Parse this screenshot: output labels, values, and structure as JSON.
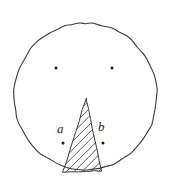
{
  "figure": {
    "kind": "hand-drawn-geometry-sketch",
    "background_color": "#ffffff",
    "stroke_color": "#3a3a3a",
    "dot_color": "#1a1a1a",
    "canvas": {
      "width": 173,
      "height": 187
    },
    "circle": {
      "name": "outer-circle",
      "center_x": 85.5,
      "center_y": 96.5,
      "radius_x": 71.5,
      "radius_y": 73.5,
      "stroke_width": 1.1,
      "filled": false
    },
    "triangle": {
      "name": "hatched-triangle",
      "apex_x": 86,
      "apex_y": 99,
      "base_left_x": 63,
      "base_left_y": 172,
      "base_right_x": 102,
      "base_right_y": 171,
      "hatch_angle_degrees": 45,
      "hatch_spacing": 8,
      "stroke_width": 1.0
    },
    "points": [
      {
        "name": "upper-left-point",
        "x": 56,
        "y": 68,
        "label": ""
      },
      {
        "name": "upper-right-point",
        "x": 112,
        "y": 68,
        "label": ""
      },
      {
        "name": "point-a",
        "x": 63,
        "y": 143,
        "label": "a"
      },
      {
        "name": "point-b",
        "x": 103,
        "y": 143,
        "label": "b"
      }
    ],
    "labels": {
      "a": "a",
      "b": "b"
    }
  }
}
